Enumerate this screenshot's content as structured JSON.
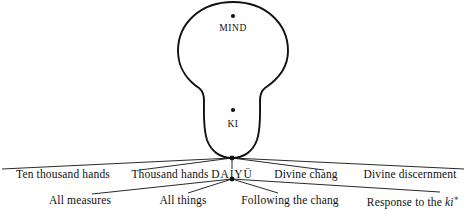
{
  "figure": {
    "type": "branching-diagram",
    "stroke_color": "#111111",
    "background_color": "#ffffff"
  },
  "organs": [
    {
      "id": "mind",
      "label": "MIND",
      "marker": "dot",
      "label_x": 233,
      "label_y": 29,
      "dot_x": 233,
      "dot_y": 16
    },
    {
      "id": "ki",
      "label": "KI",
      "marker": "dot",
      "label_x": 233,
      "label_y": 125,
      "dot_x": 233,
      "dot_y": 110
    }
  ],
  "nodes": [
    {
      "id": "upper-node",
      "x": 232,
      "y": 158
    },
    {
      "id": "lower-node",
      "x": 232,
      "y": 179
    }
  ],
  "tiers": [
    {
      "id": "upper-tier",
      "y": 175,
      "source_node": "upper-node",
      "labels": [
        {
          "id": "ten-thousand-hands",
          "text": "Ten thousand hands",
          "x": 63,
          "anchor_x": 63,
          "has_edge": true
        },
        {
          "id": "thousand-hands",
          "text": "Thousand hands",
          "x": 170,
          "anchor_x": 170,
          "has_edge": true
        },
        {
          "id": "daiyu",
          "text": "DAIYŪ",
          "x": 232,
          "anchor_x": 232,
          "has_edge": true,
          "is_center": true
        },
        {
          "id": "divine-chang",
          "text": "Divine chang",
          "x": 306,
          "anchor_x": 306,
          "has_edge": true
        },
        {
          "id": "divine-discernment",
          "text": "Divine discernment",
          "x": 410,
          "anchor_x": 410,
          "has_edge": true
        }
      ]
    },
    {
      "id": "lower-tier",
      "y": 201,
      "source_node": "lower-node",
      "labels": [
        {
          "id": "all-measures",
          "text": "All measures",
          "x": 80,
          "anchor_x": 80,
          "has_edge": true
        },
        {
          "id": "all-things",
          "text": "All things",
          "x": 183,
          "anchor_x": 183,
          "has_edge": true
        },
        {
          "id": "following-the-chang",
          "text": "Following the chang",
          "x": 290,
          "anchor_x": 290,
          "has_edge": true
        },
        {
          "id": "response-to-the-ki",
          "text": "Response to the ",
          "italic_text": "ki",
          "superscript": "∗",
          "x": 413,
          "anchor_x": 413,
          "has_edge": true
        }
      ]
    }
  ]
}
